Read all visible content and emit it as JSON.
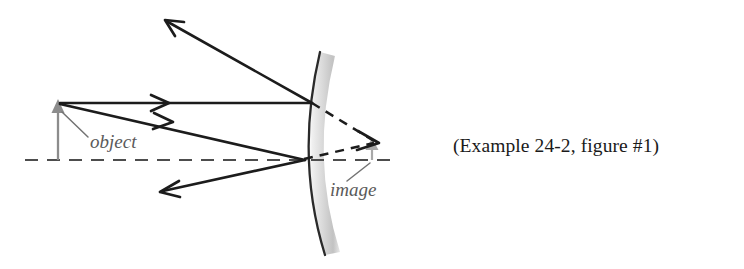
{
  "figure": {
    "caption": "(Example 24-2, figure #1)",
    "background_color": "#ffffff"
  },
  "labels": {
    "object": "object",
    "image": "image"
  },
  "colors": {
    "ray_stroke": "#1c1c1c",
    "axis_stroke": "#4d4d4d",
    "object_arrow": "#8c8c8c",
    "image_arrow": "#a8a8a8",
    "mirror_edge": "#2a2a2a",
    "mirror_body_light": "#f0f0f0",
    "mirror_body_dark": "#b8b8b8",
    "label_text": "#5a5a5a",
    "caption_text": "#1a1a1a"
  },
  "optics": {
    "mirror_type": "convex",
    "axis_y": 160,
    "axis_x_start": 25,
    "axis_x_end": 395,
    "object_x": 58,
    "object_top_y": 104,
    "object_height_px": 56,
    "image_x": 372,
    "image_top_y": 142,
    "image_height_px": 18,
    "image_nature": "virtual-upright-reduced",
    "mirror_vertex_x": 303,
    "mirror_vertex_y": 160,
    "ray_count_incident": 2,
    "ray_count_reflected": 2,
    "virtual_ray_count": 2
  },
  "geometry": {
    "mirror_arc_left": "M 320 52 Q 295 158 325 255",
    "mirror_arc_right": "M 335 56 Q 310 158 340 252",
    "ray1_incident": "M 60 103 L 312 103",
    "ray1_reflected": "M 312 103 L 166 21",
    "ray1_reflected_head": "M 178 21 L 164 20 L 172 33",
    "ray1_incident_head": "M 152 96 L 168 103 L 152 110",
    "ray2_incident": "M 60 104 L 305 160",
    "ray2_reflected": "M 305 160 L 162 191",
    "ray2_reflected_head": "M 176 182 L 160 192 L 177 196",
    "ray2_incident_head": "M 155 114 L 172 122 L 154 128",
    "virtual1": "M 312 103 L 376 142",
    "virtual2": "M 305 160 L 376 143",
    "virtual_head": "M 360 132 L 378 143 L 359 151",
    "object_shaft": "M 58 160 L 58 108",
    "object_head": "M 58 99 L 64 112 L 52 112 Z",
    "image_shaft": "M 372 160 L 372 147",
    "image_head": "M 372 139 L 377 149 L 367 149 Z",
    "axis": "M 25 160 L 395 160",
    "object_leader": "M 62 112 L 88 137",
    "image_leader": "M 370 163 L 348 180"
  },
  "text_positions": {
    "object_label_x": 90,
    "object_label_y": 148,
    "image_label_x": 330,
    "image_label_y": 196,
    "caption_x": 453,
    "caption_y": 152
  }
}
